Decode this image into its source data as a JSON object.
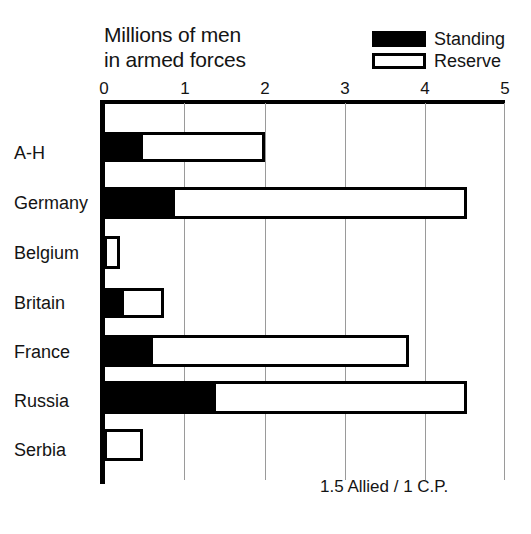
{
  "chart_data": {
    "type": "bar",
    "orientation": "horizontal",
    "stacked": true,
    "title": "Millions of men\nin armed forces",
    "xlabel": "",
    "ylabel": "",
    "xlim": [
      0,
      5
    ],
    "xticks": [
      0,
      1,
      2,
      3,
      4,
      5
    ],
    "xtick_labels": [
      "0",
      "1",
      "2",
      "3",
      "4",
      "5"
    ],
    "grid": true,
    "grid_axis": "x",
    "legend_position": "top-right",
    "categories": [
      "A-H",
      "Germany",
      "Belgium",
      "Britain",
      "France",
      "Russia",
      "Serbia"
    ],
    "series": [
      {
        "name": "Standing",
        "color": "#000000",
        "values": [
          0.48,
          0.88,
          0.03,
          0.25,
          0.61,
          1.39,
          0.03
        ]
      },
      {
        "name": "Reserve",
        "color": "#ffffff",
        "values": [
          1.52,
          3.64,
          0.17,
          0.5,
          3.19,
          3.13,
          0.45
        ]
      }
    ],
    "totals": [
      2.0,
      4.52,
      0.2,
      0.75,
      3.8,
      4.52,
      0.48
    ],
    "annotations": [
      "1.5 Allied / 1 C.P."
    ]
  },
  "title": {
    "line1": "Millions of men",
    "line2": "in armed forces",
    "full": "Millions of men\nin armed forces"
  },
  "legend": {
    "items": [
      {
        "label": "Standing",
        "swatch": "filled-black"
      },
      {
        "label": "Reserve",
        "swatch": "outlined-white"
      }
    ]
  },
  "axis": {
    "ticks": [
      {
        "label": "0",
        "value": 0
      },
      {
        "label": "1",
        "value": 1
      },
      {
        "label": "2",
        "value": 2
      },
      {
        "label": "3",
        "value": 3
      },
      {
        "label": "4",
        "value": 4
      },
      {
        "label": "5",
        "value": 5
      }
    ]
  },
  "rows": [
    {
      "label": "A-H",
      "standing": 0.48,
      "total": 2.0
    },
    {
      "label": "Germany",
      "standing": 0.88,
      "total": 4.52
    },
    {
      "label": "Belgium",
      "standing": 0.03,
      "total": 0.2
    },
    {
      "label": "Britain",
      "standing": 0.25,
      "total": 0.75
    },
    {
      "label": "France",
      "standing": 0.61,
      "total": 3.8
    },
    {
      "label": "Russia",
      "standing": 1.39,
      "total": 4.52
    },
    {
      "label": "Serbia",
      "standing": 0.03,
      "total": 0.48
    }
  ],
  "footnote": {
    "text": "1.5 Allied / 1 C.P."
  },
  "colors": {
    "standing": "#000000",
    "reserve": "#ffffff",
    "outline": "#000000",
    "grid": "#9a9a9a",
    "text": "#141414",
    "background": "#ffffff"
  }
}
